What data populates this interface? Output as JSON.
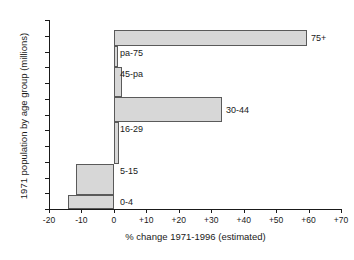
{
  "chart_data": {
    "type": "bar",
    "orientation": "horizontal",
    "title": "",
    "xlabel": "% change 1971-1996 (estimated)",
    "ylabel": "1971 population by age group (millions)",
    "xlim": [
      -20,
      70
    ],
    "ylim": [
      0,
      60
    ],
    "grid": false,
    "legend": "none",
    "xticks": [
      "-20",
      "-10",
      "0",
      "+10",
      "+20",
      "+30",
      "+40",
      "+50",
      "+60",
      "+70"
    ],
    "xtick_values": [
      -20,
      -10,
      0,
      10,
      20,
      30,
      40,
      50,
      60,
      70
    ],
    "yticks": [
      "0",
      "5",
      "10",
      "15",
      "20",
      "25",
      "30",
      "35",
      "40",
      "45",
      "50",
      "55",
      "60"
    ],
    "ytick_values": [
      0,
      5,
      10,
      15,
      20,
      25,
      30,
      35,
      40,
      45,
      50,
      55,
      60
    ],
    "note": "Bar widths = % change 1971-1996; bar thickness (vertical extent) = size of the 1971 population in that age group, stacked cumulatively from 0 up the y-axis.",
    "categories": [
      "0-4",
      "5-15",
      "16-29",
      "30-44",
      "45-pa",
      "pa-75",
      "75+"
    ],
    "values": [
      -14.2,
      -11.7,
      1.5,
      33.3,
      2.5,
      1.2,
      59.5
    ],
    "bands": [
      {
        "label": "0-4",
        "pct_change": -14.2,
        "pop_from": 0.0,
        "pop_to": 4.4
      },
      {
        "label": "5-15",
        "pct_change": -11.7,
        "pop_from": 4.4,
        "pop_to": 14.3
      },
      {
        "label": "16-29",
        "pct_change": 1.5,
        "pop_from": 14.3,
        "pop_to": 27.5
      },
      {
        "label": "30-44",
        "pct_change": 33.3,
        "pop_from": 27.5,
        "pop_to": 35.5
      },
      {
        "label": "45-pa",
        "pct_change": 2.5,
        "pop_from": 35.5,
        "pop_to": 45.0
      },
      {
        "label": "pa-75",
        "pct_change": 1.2,
        "pop_from": 45.0,
        "pop_to": 51.7
      },
      {
        "label": "75+",
        "pct_change": 59.5,
        "pop_from": 51.7,
        "pop_to": 56.8
      }
    ],
    "colors": {
      "bar_fill": "#d7d7d7",
      "bar_stroke": "#5a5a5a",
      "axis": "#1a1a1a",
      "text": "#1a1a1a",
      "background": "#ffffff"
    }
  }
}
